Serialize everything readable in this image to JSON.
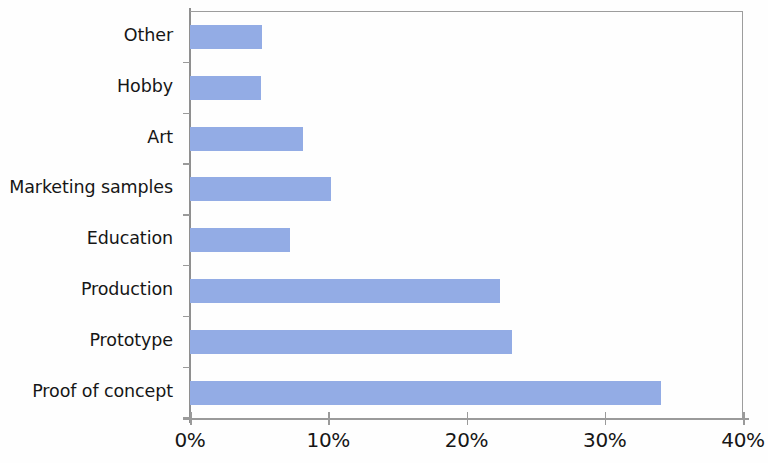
{
  "chart_data": {
    "type": "bar",
    "orientation": "horizontal",
    "title": "",
    "subtitle": "",
    "xlabel": "",
    "ylabel": "",
    "categories": [
      "Other",
      "Hobby",
      "Art",
      "Marketing samples",
      "Education",
      "Production",
      "Prototype",
      "Proof of concept"
    ],
    "values": [
      5.2,
      5.1,
      8.2,
      10.2,
      7.2,
      22.4,
      23.3,
      34.1
    ],
    "value_unit": "%",
    "xlim": [
      0,
      40
    ],
    "xticks": [
      0,
      10,
      20,
      30,
      40
    ],
    "xtick_labels": [
      "0%",
      "10%",
      "20%",
      "30%",
      "40%"
    ],
    "grid": false,
    "legend": null,
    "bar_color": "#93ace5",
    "axis_color": "#9a9a9a",
    "text_color": "#161616"
  }
}
